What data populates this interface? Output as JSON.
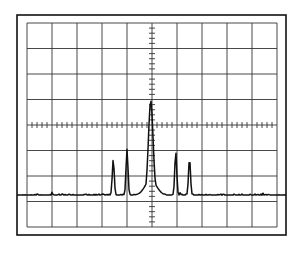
{
  "chart_data": {
    "type": "line",
    "title": "",
    "xlabel": "",
    "ylabel": "",
    "graticule": {
      "h_divisions": 10,
      "v_divisions": 8,
      "minor_ticks_per_division": 5,
      "grid": true
    },
    "xlim": [
      -5,
      5
    ],
    "ylim": [
      -4,
      4
    ],
    "baseline_div": -2.75,
    "peaks": [
      {
        "name": "sideband-left-2",
        "x_div": -1.55,
        "y_div": -1.35
      },
      {
        "name": "sideband-left-1",
        "x_div": -1.0,
        "y_div": -0.95
      },
      {
        "name": "carrier",
        "x_div": -0.05,
        "y_div": 0.95
      },
      {
        "name": "sideband-right-1",
        "x_div": 0.95,
        "y_div": -1.05
      },
      {
        "name": "sideband-right-2",
        "x_div": 1.5,
        "y_div": -1.3
      }
    ],
    "legend": []
  },
  "colors": {
    "trace": "#111111",
    "grid": "#333333",
    "frame": "#111111",
    "background": "#ffffff"
  },
  "geometry": {
    "frame": {
      "x": 17,
      "y": 15,
      "w": 269,
      "h": 220
    },
    "grid": {
      "x": 27,
      "y": 23,
      "w": 250,
      "h": 204
    }
  }
}
